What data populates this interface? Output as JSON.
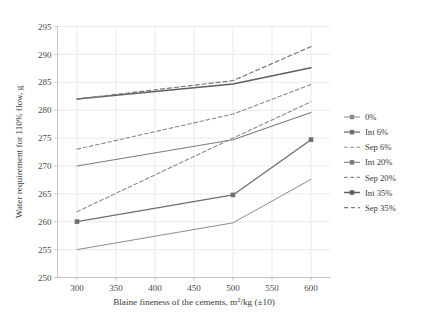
{
  "chart_data": {
    "type": "line",
    "title": "",
    "xlabel": "Blaine fineness of the cements, m²/kg (±10)",
    "ylabel": "Water requirement for 110% flow, g",
    "x": [
      300,
      500,
      600
    ],
    "xlim": [
      275,
      625
    ],
    "ylim": [
      250,
      295
    ],
    "xticks": [
      300,
      350,
      400,
      450,
      500,
      550,
      600
    ],
    "yticks": [
      250,
      255,
      260,
      265,
      270,
      275,
      280,
      285,
      290,
      295
    ],
    "xtick_labels": [
      "300",
      "350",
      "400",
      "450",
      "500",
      "550",
      "600"
    ],
    "ytick_labels": [
      "250",
      "255",
      "260",
      "265",
      "270",
      "275",
      "280",
      "285",
      "290",
      "295"
    ],
    "grid": true,
    "legend_position": "right",
    "series": [
      {
        "name": "0%",
        "values": [
          255.0,
          259.8,
          267.6
        ],
        "color": "#8d8d8d",
        "dash": "none",
        "width": 1.0,
        "marker": "none"
      },
      {
        "name": "Int 6%",
        "values": [
          260.0,
          264.8,
          274.7
        ],
        "color": "#6f6f6f",
        "dash": "none",
        "width": 1.3,
        "marker": "square"
      },
      {
        "name": "Sep 6%",
        "values": [
          261.8,
          275.0,
          281.5
        ],
        "color": "#8a8a8a",
        "dash": "dashed",
        "width": 1.1,
        "marker": "none"
      },
      {
        "name": "Int 20%",
        "values": [
          270.0,
          274.7,
          279.6
        ],
        "color": "#7c7c7c",
        "dash": "none",
        "width": 1.1,
        "marker": "none"
      },
      {
        "name": "Sep 20%",
        "values": [
          273.0,
          279.3,
          284.6
        ],
        "color": "#8a8a8a",
        "dash": "dashed",
        "width": 1.1,
        "marker": "none"
      },
      {
        "name": "Int 35%",
        "values": [
          282.0,
          284.7,
          287.6
        ],
        "color": "#5f5f5f",
        "dash": "none",
        "width": 1.5,
        "marker": "none"
      },
      {
        "name": "Sep 35%",
        "values": [
          282.0,
          285.3,
          291.4
        ],
        "color": "#7a7a7a",
        "dash": "dashed",
        "width": 1.2,
        "marker": "none"
      }
    ]
  },
  "legend": {
    "items": [
      {
        "label": "0%"
      },
      {
        "label": "Int 6%"
      },
      {
        "label": "Sep 6%"
      },
      {
        "label": "Int 20%"
      },
      {
        "label": "Sep 20%"
      },
      {
        "label": "Int 35%"
      },
      {
        "label": "Sep 35%"
      }
    ]
  }
}
